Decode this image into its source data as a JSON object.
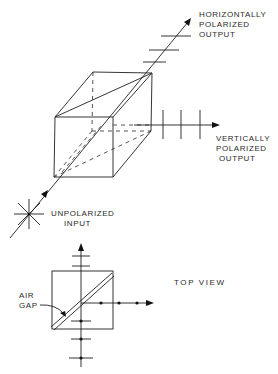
{
  "figure": {
    "isometric_view": {
      "labels": {
        "horizontal_output": [
          "HORIZONTALLY",
          "POLARIZED",
          "OUTPUT"
        ],
        "vertical_output": [
          "VERTICALLY",
          "POLARIZED",
          "OUTPUT"
        ],
        "input": [
          "UNPOLARIZED",
          "INPUT"
        ]
      },
      "horizontal_output_polarization_marks": 3,
      "vertical_output_polarization_marks": 3
    },
    "top_view": {
      "label": "TOP VIEW",
      "air_gap_label": [
        "AIR",
        "GAP"
      ],
      "transmitted_polarization_marks": 2,
      "reflected_dot_marks": 3,
      "input_dot_marks": 3
    }
  }
}
